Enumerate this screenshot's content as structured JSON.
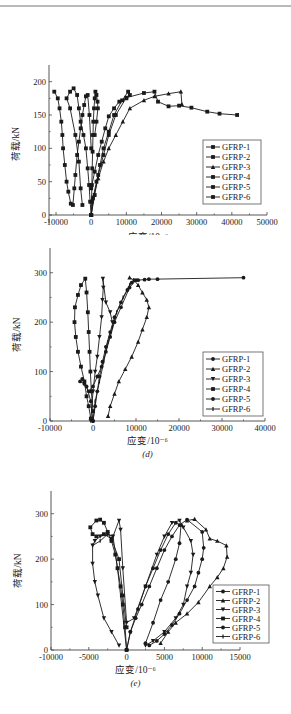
{
  "page": {
    "rule_color": "#b9b9b9"
  },
  "chart_data": [
    {
      "id": "c",
      "type": "line",
      "caption": "(c)",
      "xlabel": "应变/10⁻⁶",
      "ylabel": "荷载/kN",
      "xlim": [
        -12000,
        50000
      ],
      "ylim": [
        -12,
        225
      ],
      "xticks": [
        -10000,
        0,
        10000,
        20000,
        30000,
        40000,
        50000
      ],
      "xtick_labels": [
        "-10000",
        "0",
        "10000",
        "20000",
        "30000",
        "40000",
        "50000"
      ],
      "yticks": [
        0,
        50,
        100,
        150,
        200
      ],
      "ytick_labels": [
        "0",
        "50",
        "100",
        "150",
        "200"
      ],
      "grid": false,
      "legend_position": "lower right",
      "layout": {
        "top": 30,
        "height": 205,
        "px0": 49,
        "px1": 267,
        "py0": 193,
        "py1": 35
      },
      "legend": {
        "x": 203,
        "y": 110,
        "w": 58,
        "h": 64
      },
      "series": [
        {
          "name": "GFRP-1",
          "marker": "square",
          "x": [
            0,
            100,
            200,
            300,
            400,
            500,
            600,
            800,
            1000,
            1200,
            1500,
            1800,
            1900,
            1500,
            1000
          ],
          "y": [
            0,
            20,
            45,
            70,
            95,
            120,
            140,
            160,
            175,
            185,
            180,
            170,
            160,
            140,
            120
          ]
        },
        {
          "name": "GFRP-2",
          "marker": "square",
          "x": [
            0,
            500,
            1500,
            2500,
            3500,
            5000,
            6500,
            8800,
            10500,
            11000,
            10000,
            8000,
            6500,
            5000,
            4000,
            3000,
            2000,
            1000,
            0
          ],
          "y": [
            0,
            25,
            50,
            75,
            100,
            125,
            150,
            172,
            185,
            180,
            175,
            170,
            160,
            148,
            130,
            110,
            90,
            65,
            40
          ]
        },
        {
          "name": "GFRP-3",
          "marker": "triangle",
          "x": [
            0,
            800,
            2000,
            3500,
            5000,
            7000,
            9000,
            11000,
            15000,
            18000,
            22000,
            25500,
            25800
          ],
          "y": [
            0,
            30,
            55,
            80,
            100,
            120,
            140,
            160,
            172,
            178,
            182,
            185,
            166
          ]
        },
        {
          "name": "GFRP-4",
          "marker": "square",
          "x": [
            0,
            1000,
            2000,
            3500,
            5000,
            7000,
            10000,
            15000,
            18000,
            19000,
            22000,
            25000,
            28500,
            33000,
            36500,
            41500
          ],
          "y": [
            0,
            30,
            60,
            90,
            120,
            150,
            176,
            183,
            185,
            170,
            163,
            164,
            161,
            155,
            152,
            150
          ]
        },
        {
          "name": "GFRP-5",
          "marker": "square",
          "x": [
            0,
            -300,
            -600,
            -1000,
            -1500,
            -2200,
            -3000,
            -3500,
            -4000,
            -5000,
            -6000,
            -7000,
            -6000,
            -4500,
            -3500,
            -3000,
            -2500
          ],
          "y": [
            0,
            20,
            45,
            70,
            100,
            120,
            140,
            160,
            180,
            190,
            185,
            175,
            160,
            120,
            80,
            40,
            15
          ]
        },
        {
          "name": "GFRP-6",
          "marker": "square",
          "x": [
            -10500,
            -9500,
            -9000,
            -8500,
            -8200,
            -8000,
            -7500,
            -7000,
            -6500,
            -5800,
            -5200,
            -4800,
            -4500,
            -4000,
            -3500,
            -3000,
            -2500,
            -2000,
            -1500,
            -1000,
            -500,
            0
          ],
          "y": [
            185,
            175,
            160,
            140,
            120,
            100,
            75,
            50,
            35,
            17,
            15,
            40,
            60,
            90,
            110,
            130,
            150,
            165,
            178,
            180,
            150,
            100
          ]
        }
      ]
    },
    {
      "id": "d",
      "type": "line",
      "caption": "(d)",
      "xlabel": "应变/10⁻⁶",
      "ylabel": "荷载/kN",
      "xlim": [
        -10000,
        40000
      ],
      "ylim": [
        0,
        350
      ],
      "xticks": [
        -10000,
        0,
        10000,
        20000,
        30000,
        40000
      ],
      "xtick_labels": [
        "-10000",
        "0",
        "10000",
        "20000",
        "30000",
        "40000"
      ],
      "yticks": [
        0,
        100,
        200,
        300
      ],
      "ytick_labels": [
        "0",
        "100",
        "200",
        "300"
      ],
      "grid": false,
      "legend_position": "lower right",
      "layout": {
        "top": 240,
        "height": 235,
        "px0": 50,
        "px1": 265,
        "py0": 181,
        "py1": 8
      },
      "legend": {
        "x": 203,
        "y": 112,
        "w": 60,
        "h": 64
      },
      "series": [
        {
          "name": "GFRP-1",
          "marker": "circle",
          "x": [
            0,
            500,
            1000,
            1500,
            2200,
            3000,
            4000,
            5000,
            6500,
            8000,
            9000,
            10500,
            12000,
            13000,
            15000,
            35000
          ],
          "y": [
            0,
            30,
            60,
            90,
            120,
            150,
            180,
            210,
            240,
            265,
            280,
            285,
            286,
            287,
            287,
            290
          ]
        },
        {
          "name": "GFRP-2",
          "marker": "triangle",
          "x": [
            3500,
            4000,
            5000,
            6000,
            7500,
            9000,
            10500,
            11500,
            12500,
            13000,
            12500,
            11500,
            10500,
            9500,
            8500
          ],
          "y": [
            10,
            30,
            55,
            80,
            105,
            130,
            160,
            185,
            210,
            230,
            245,
            260,
            275,
            285,
            290
          ]
        },
        {
          "name": "GFRP-3",
          "marker": "triangleDown",
          "x": [
            -500,
            0,
            500,
            1000,
            1500,
            2000,
            2200,
            2400,
            2300,
            3000,
            4000,
            4500
          ],
          "y": [
            0,
            60,
            100,
            130,
            170,
            210,
            245,
            270,
            288,
            240,
            220,
            200
          ]
        },
        {
          "name": "GFRP-4",
          "marker": "square",
          "x": [
            -500,
            -1000,
            -1500,
            -2000,
            -2800,
            -3500,
            -4000,
            -4300,
            -4200,
            -3500,
            -2800,
            -1800,
            -1500,
            -1200,
            -1000,
            -800,
            -600,
            -400,
            0
          ],
          "y": [
            5,
            30,
            50,
            80,
            110,
            140,
            170,
            200,
            230,
            255,
            275,
            288,
            260,
            220,
            180,
            140,
            100,
            60,
            20
          ]
        },
        {
          "name": "GFRP-5",
          "marker": "circle",
          "x": [
            0,
            -500,
            -1500,
            -2500,
            -3000,
            -2000,
            -1000,
            0,
            1000,
            2000,
            3000,
            4000,
            5000,
            6500,
            8500,
            10000
          ],
          "y": [
            0,
            40,
            70,
            85,
            80,
            75,
            60,
            70,
            90,
            110,
            140,
            170,
            200,
            230,
            270,
            285
          ]
        },
        {
          "name": "GFRP-6",
          "marker": "tick",
          "x": [
            0,
            500,
            1500,
            2500,
            3500,
            4500,
            5500,
            7000,
            8500,
            9500
          ],
          "y": [
            0,
            40,
            80,
            120,
            160,
            190,
            220,
            250,
            275,
            285
          ]
        }
      ]
    },
    {
      "id": "e",
      "type": "line",
      "caption": "(e)",
      "xlabel": "应变/10⁻⁶",
      "ylabel": "荷载/kN",
      "xlim": [
        -10000,
        15000
      ],
      "ylim": [
        0,
        350
      ],
      "xticks": [
        -10000,
        -5000,
        0,
        5000,
        10000,
        15000
      ],
      "xtick_labels": [
        "-10000",
        "-5000",
        "0",
        "5000",
        "10000",
        "15000"
      ],
      "yticks": [
        0,
        100,
        200,
        300
      ],
      "ytick_labels": [
        "0",
        "100",
        "200",
        "300"
      ],
      "grid": false,
      "legend_position": "lower right",
      "layout": {
        "top": 470,
        "height": 244,
        "px0": 51,
        "px1": 240,
        "py0": 180,
        "py1": 21
      },
      "legend": {
        "x": 213,
        "y": 115,
        "w": 56,
        "h": 58
      },
      "series": [
        {
          "name": "GFRP-1",
          "marker": "circle",
          "x": [
            0,
            500,
            1200,
            2000,
            3000,
            4000,
            5000,
            6000,
            7000,
            8000,
            10000,
            10200,
            10000,
            9500,
            9000,
            8000,
            7000,
            6000,
            5000,
            4000,
            3000
          ],
          "y": [
            0,
            40,
            70,
            100,
            140,
            180,
            220,
            250,
            275,
            287,
            260,
            225,
            200,
            170,
            140,
            110,
            80,
            55,
            35,
            20,
            10
          ]
        },
        {
          "name": "GFRP-2",
          "marker": "triangle",
          "x": [
            4500,
            5500,
            6500,
            8000,
            9500,
            11000,
            12000,
            12800,
            13300,
            13200,
            12000,
            11000,
            10500,
            9000,
            8000
          ],
          "y": [
            15,
            40,
            60,
            80,
            105,
            140,
            160,
            180,
            205,
            230,
            240,
            245,
            265,
            288,
            285
          ]
        },
        {
          "name": "GFRP-3",
          "marker": "triangleDown",
          "x": [
            -1000,
            -2000,
            -3000,
            -3800,
            -4200,
            -4500,
            -4500,
            -4200,
            -3500,
            -2500,
            -1800,
            -1000,
            -800,
            -500,
            0,
            1000,
            2500,
            4000,
            5000,
            6000,
            7000,
            7500,
            8500,
            8800,
            8500,
            8000,
            7500,
            6500,
            5000,
            3500,
            2500
          ],
          "y": [
            10,
            40,
            70,
            120,
            150,
            190,
            230,
            240,
            250,
            255,
            250,
            285,
            265,
            180,
            60,
            70,
            140,
            210,
            250,
            280,
            285,
            270,
            240,
            210,
            170,
            140,
            100,
            70,
            40,
            20,
            10
          ]
        },
        {
          "name": "GFRP-4",
          "marker": "square",
          "x": [
            0,
            -200,
            -500,
            -800,
            -1200,
            -1500,
            -2000,
            -2500,
            -3000,
            -3500,
            -4000,
            -4800,
            -4500,
            -4000,
            -3000,
            -2000,
            -1000,
            -500,
            0
          ],
          "y": [
            0,
            50,
            100,
            140,
            180,
            210,
            240,
            260,
            280,
            287,
            285,
            270,
            255,
            250,
            255,
            245,
            200,
            120,
            50
          ]
        },
        {
          "name": "GFRP-5",
          "marker": "circle",
          "x": [
            0,
            500,
            1500,
            2500,
            3500,
            4500,
            5500,
            6500,
            7200,
            7000,
            6500,
            5500,
            4500,
            3500,
            2500
          ],
          "y": [
            0,
            40,
            90,
            140,
            180,
            220,
            255,
            280,
            275,
            235,
            200,
            150,
            110,
            60,
            15
          ]
        },
        {
          "name": "GFRP-6",
          "marker": "tick",
          "x": [
            -4500,
            -3500,
            -2500,
            -1800,
            -1200,
            -800,
            -400,
            0
          ],
          "y": [
            230,
            240,
            255,
            250,
            180,
            120,
            60,
            0
          ]
        }
      ]
    }
  ],
  "legend_labels": [
    "GFRP-1",
    "GFRP-2",
    "GFRP-3",
    "GFRP-4",
    "GFRP-5",
    "GFRP-6"
  ]
}
